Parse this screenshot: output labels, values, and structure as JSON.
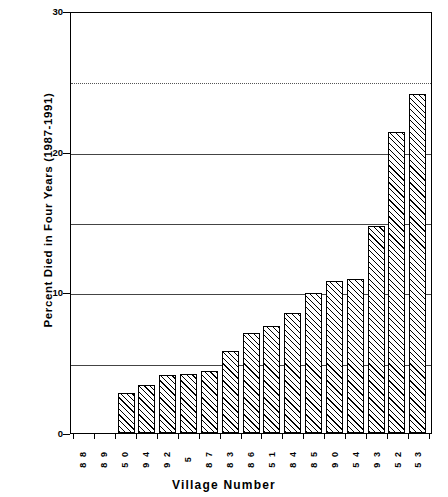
{
  "chart_data": {
    "type": "bar",
    "title": "",
    "xlabel": "Village  Number",
    "ylabel": "Percent  Died  in  Four  Years  (1987-1991)",
    "categories": [
      "88",
      "89",
      "50",
      "94",
      "92",
      "5",
      "87",
      "83",
      "86",
      "51",
      "84",
      "85",
      "90",
      "54",
      "93",
      "52",
      "53"
    ],
    "values": [
      0,
      0,
      2.9,
      3.5,
      4.2,
      4.3,
      4.5,
      5.9,
      7.2,
      7.7,
      8.6,
      10.0,
      10.9,
      11.0,
      14.8,
      21.5,
      24.2
    ],
    "ylim": [
      0,
      30
    ],
    "yticks": [
      0,
      10,
      20,
      30
    ],
    "ytick_labels": [
      "0",
      "10",
      "20",
      "30"
    ],
    "gridlines": [
      5,
      10,
      15,
      20,
      25
    ],
    "grid": true,
    "legend": null,
    "bar_fill": "diagonal-hatch",
    "axis_color": "#000000"
  }
}
